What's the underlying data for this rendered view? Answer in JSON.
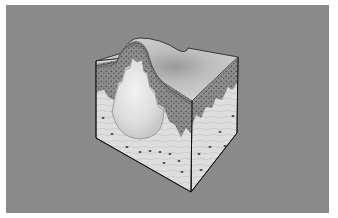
{
  "figure": {
    "colors": {
      "background_panel": "#8a8a8a",
      "frame": "#ffffff",
      "skin_surface": "#c9c9c9",
      "epidermis_stipple": "#6f6f6f",
      "dermis": "#dcdcdc",
      "cyst": "#e4e4e4",
      "outline": "#1a1a1a"
    },
    "caption": ""
  }
}
